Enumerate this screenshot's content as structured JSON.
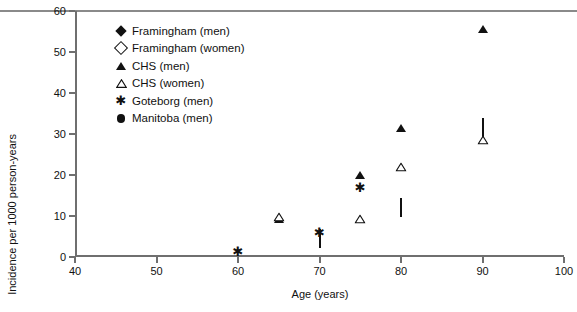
{
  "chart_data": {
    "type": "scatter",
    "title": "",
    "xlabel": "Age (years)",
    "ylabel": "Incidence per 1000 person-years",
    "xlim": [
      40,
      100
    ],
    "ylim": [
      0,
      60
    ],
    "xticks": [
      40,
      50,
      60,
      70,
      80,
      90,
      100
    ],
    "yticks": [
      0,
      10,
      20,
      30,
      40,
      50,
      60
    ],
    "grid": false,
    "legend_position": "upper left",
    "series": [
      {
        "name": "Framingham (men)",
        "marker": "filled-diamond",
        "color": "#111111",
        "points": [
          [
            70,
            9.5
          ],
          [
            80,
            19.5
          ],
          [
            90,
            38
          ]
        ]
      },
      {
        "name": "Framingham (women)",
        "marker": "open-diamond",
        "color": "#111111",
        "points": [
          [
            70,
            4.5
          ],
          [
            80,
            12
          ],
          [
            90,
            31.5
          ]
        ]
      },
      {
        "name": "CHS (men)",
        "marker": "filled-triangle",
        "color": "#111111",
        "points": [
          [
            65,
            12.3
          ],
          [
            75,
            23
          ],
          [
            80,
            34.5
          ],
          [
            90,
            58.5
          ]
        ]
      },
      {
        "name": "CHS (women)",
        "marker": "open-triangle",
        "color": "#111111",
        "points": [
          [
            65,
            9.8
          ],
          [
            75,
            9.3
          ],
          [
            80,
            22
          ],
          [
            90,
            28.5
          ]
        ]
      },
      {
        "name": "Goteborg (men)",
        "marker": "asterisk",
        "color": "#111111",
        "points": [
          [
            60,
            1.5
          ],
          [
            70,
            6
          ],
          [
            75,
            17
          ]
        ]
      },
      {
        "name": "Manitoba (men)",
        "marker": "filled-circle",
        "color": "#111111",
        "points": [
          [
            45,
            0.3
          ],
          [
            50,
            0.6
          ],
          [
            55,
            1.5
          ],
          [
            60,
            3
          ],
          [
            65,
            7.6
          ],
          [
            70,
            8.5
          ],
          [
            75,
            11
          ]
        ]
      }
    ]
  },
  "legend": {
    "items": [
      {
        "label": "Framingham (men)",
        "marker": "filled-diamond"
      },
      {
        "label": "Framingham (women)",
        "marker": "open-diamond"
      },
      {
        "label": "CHS (men)",
        "marker": "filled-triangle"
      },
      {
        "label": "CHS (women)",
        "marker": "open-triangle"
      },
      {
        "label": "Goteborg (men)",
        "marker": "asterisk"
      },
      {
        "label": "Manitoba (men)",
        "marker": "filled-circle"
      }
    ]
  },
  "axis_labels": {
    "x": "Age (years)",
    "y": "Incidence per 1000 person-years"
  }
}
